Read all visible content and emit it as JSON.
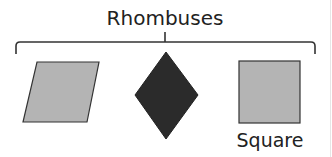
{
  "title": "Rhombuses",
  "shapes": [
    {
      "name": "rhombus-slanted",
      "fill": "#b4b4b4",
      "label": ""
    },
    {
      "name": "diamond",
      "fill": "#2b2b2b",
      "label": ""
    },
    {
      "name": "square",
      "fill": "#b4b4b4",
      "label": "Square"
    }
  ],
  "colors": {
    "stroke": "#333333",
    "text": "#222222"
  }
}
